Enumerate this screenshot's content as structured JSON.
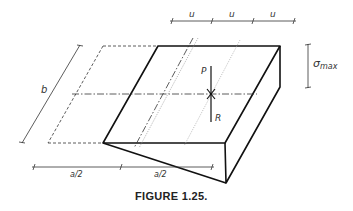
{
  "figure": {
    "caption": "FIGURE 1.25.",
    "labels": {
      "u1": "u",
      "u2": "u",
      "u3": "u",
      "sigma_max": "σ",
      "sigma_sub": "max",
      "b": "b",
      "P": "P",
      "R": "R",
      "a_half_left": "a/2",
      "a_half_right": "a/2"
    },
    "colors": {
      "line": "#111111",
      "thin_line": "#444444",
      "dotted_line": "#999999"
    }
  }
}
